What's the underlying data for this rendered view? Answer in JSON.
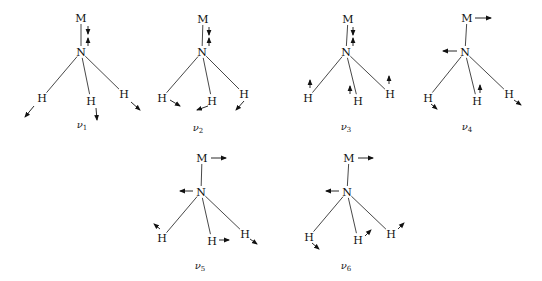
{
  "diagram": {
    "title": "",
    "atom_labels": {
      "metal": "M",
      "nitrogen": "N",
      "hydrogen": "H"
    },
    "modes": [
      {
        "id": "v1",
        "label": "ν",
        "subscript": "1",
        "description": "symmetric: M-N stretch (vertical arrows), all H moving outward/down",
        "M": [
          81,
          18
        ],
        "N": [
          81,
          52
        ],
        "H": [
          [
            42,
            98
          ],
          [
            91,
            101
          ],
          [
            124,
            94
          ]
        ],
        "label_pos": [
          82,
          128
        ],
        "arrows": [
          {
            "from": [
              88,
              26
            ],
            "to": [
              88,
              34
            ]
          },
          {
            "from": [
              88,
              46
            ],
            "to": [
              88,
              38
            ]
          },
          {
            "from": [
              34,
              106
            ],
            "to": [
              25,
              117
            ]
          },
          {
            "from": [
              96,
              108
            ],
            "to": [
              97,
              120
            ]
          },
          {
            "from": [
              131,
              102
            ],
            "to": [
              140,
              110
            ]
          }
        ]
      },
      {
        "id": "v2",
        "label": "ν",
        "subscript": "2",
        "description": "M-N stretch with H in-plane deformation",
        "M": [
          203,
          19
        ],
        "N": [
          202,
          52
        ],
        "H": [
          [
            162,
            98
          ],
          [
            212,
            101
          ],
          [
            244,
            94
          ]
        ],
        "label_pos": [
          198,
          131
        ],
        "arrows": [
          {
            "from": [
              209,
              27
            ],
            "to": [
              209,
              35
            ]
          },
          {
            "from": [
              209,
              46
            ],
            "to": [
              209,
              38
            ]
          },
          {
            "from": [
              170,
              100
            ],
            "to": [
              180,
              106
            ]
          },
          {
            "from": [
              208,
              106
            ],
            "to": [
              197,
              110
            ]
          },
          {
            "from": [
              244,
              101
            ],
            "to": [
              236,
              110
            ]
          }
        ]
      },
      {
        "id": "v3",
        "label": "ν",
        "subscript": "3",
        "description": "M-N stretch with H moving up",
        "M": [
          348,
          19
        ],
        "N": [
          346,
          52
        ],
        "H": [
          [
            308,
            98
          ],
          [
            358,
            101
          ],
          [
            390,
            94
          ]
        ],
        "label_pos": [
          346,
          130
        ],
        "arrows": [
          {
            "from": [
              353,
              27
            ],
            "to": [
              353,
              35
            ]
          },
          {
            "from": [
              353,
              46
            ],
            "to": [
              353,
              38
            ]
          },
          {
            "from": [
              310,
              88
            ],
            "to": [
              310,
              80
            ]
          },
          {
            "from": [
              350,
              94
            ],
            "to": [
              350,
              86
            ]
          },
          {
            "from": [
              389,
              84
            ],
            "to": [
              389,
              76
            ]
          }
        ]
      },
      {
        "id": "v4",
        "label": "ν",
        "subscript": "4",
        "description": "M horizontal right, N horizontal left, H rocking",
        "M": [
          467,
          18
        ],
        "N": [
          465,
          52
        ],
        "H": [
          [
            428,
            98
          ],
          [
            477,
            101
          ],
          [
            509,
            94
          ]
        ],
        "label_pos": [
          467,
          130
        ],
        "arrows": [
          {
            "from": [
              475,
              18
            ],
            "to": [
              491,
              18
            ]
          },
          {
            "from": [
              457,
              51
            ],
            "to": [
              443,
              51
            ]
          },
          {
            "from": [
              431,
              104
            ],
            "to": [
              437,
              109
            ]
          },
          {
            "from": [
              480,
              93
            ],
            "to": [
              480,
              85
            ]
          },
          {
            "from": [
              514,
              100
            ],
            "to": [
              521,
              105
            ]
          }
        ]
      },
      {
        "id": "v5",
        "label": "ν",
        "subscript": "5",
        "description": "M right, N left, H asymmetric motion",
        "M": [
          202,
          158
        ],
        "N": [
          201,
          192
        ],
        "H": [
          [
            162,
            238
          ],
          [
            212,
            241
          ],
          [
            245,
            234
          ]
        ],
        "label_pos": [
          200,
          269
        ],
        "arrows": [
          {
            "from": [
              211,
              158
            ],
            "to": [
              226,
              158
            ]
          },
          {
            "from": [
              193,
              191
            ],
            "to": [
              180,
              191
            ]
          },
          {
            "from": [
              160,
              229
            ],
            "to": [
              154,
              224
            ]
          },
          {
            "from": [
              219,
              240
            ],
            "to": [
              229,
              240
            ]
          },
          {
            "from": [
              250,
              239
            ],
            "to": [
              257,
              244
            ]
          }
        ]
      },
      {
        "id": "v6",
        "label": "ν",
        "subscript": "6",
        "description": "M right, N left, H asymmetric motion",
        "M": [
          349,
          158
        ],
        "N": [
          347,
          192
        ],
        "H": [
          [
            309,
            237
          ],
          [
            358,
            240
          ],
          [
            391,
            234
          ]
        ],
        "label_pos": [
          346,
          269
        ],
        "arrows": [
          {
            "from": [
              358,
              158
            ],
            "to": [
              373,
              158
            ]
          },
          {
            "from": [
              339,
              191
            ],
            "to": [
              326,
              191
            ]
          },
          {
            "from": [
              312,
              243
            ],
            "to": [
              319,
              249
            ]
          },
          {
            "from": [
              365,
              236
            ],
            "to": [
              371,
              230
            ]
          },
          {
            "from": [
              398,
              229
            ],
            "to": [
              404,
              223
            ]
          }
        ]
      }
    ]
  }
}
